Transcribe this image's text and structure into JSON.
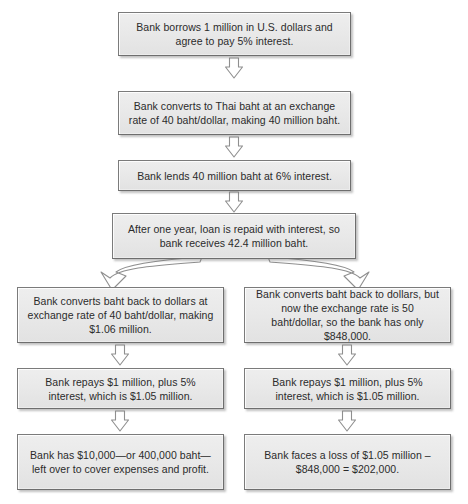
{
  "diagram": {
    "colors": {
      "node_fill": "#e9e9e9",
      "node_border": "#7b7b7b",
      "text": "#2b2b2b",
      "arrow_fill": "#ffffff",
      "arrow_stroke": "#8c8c8c",
      "background": "#ffffff"
    },
    "nodes": {
      "borrow": "Bank borrows 1 million in U.S. dollars and agree to pay 5% interest.",
      "convert": "Bank converts to Thai baht at an exchange rate of 40 baht/dollar, making 40 million baht.",
      "lend": "Bank lends 40 million baht at 6% interest.",
      "repaid": "After one year, loan is repaid with interest, so bank receives 42.4 million baht.",
      "left_convert": "Bank converts baht back to dollars at exchange rate of 40 baht/dollar, making $1.06 million.",
      "left_repay": "Bank repays $1 million, plus 5% interest, which is $1.05 million.",
      "left_result": "Bank has $10,000—or 400,000 baht—left over to cover expenses and profit.",
      "right_convert": "Bank converts baht back to dollars, but now the exchange rate is 50 baht/dollar, so the bank has only $848,000.",
      "right_repay": "Bank repays $1 million, plus 5% interest, which is $1.05 million.",
      "right_result": "Bank faces a loss of $1.05 million – $848,000 = $202,000."
    },
    "connectors": [
      {
        "name": "borrow-to-convert",
        "kind": "straight-down-arrow"
      },
      {
        "name": "convert-to-lend",
        "kind": "straight-down-arrow"
      },
      {
        "name": "lend-to-repaid",
        "kind": "straight-down-arrow"
      },
      {
        "name": "repaid-to-left-convert",
        "kind": "curved-arrow-left"
      },
      {
        "name": "repaid-to-right-convert",
        "kind": "curved-arrow-right"
      },
      {
        "name": "left-convert-to-left-repay",
        "kind": "straight-down-arrow"
      },
      {
        "name": "left-repay-to-left-result",
        "kind": "straight-down-arrow"
      },
      {
        "name": "right-convert-to-right-repay",
        "kind": "straight-down-arrow"
      },
      {
        "name": "right-repay-to-right-result",
        "kind": "straight-down-arrow"
      }
    ]
  }
}
